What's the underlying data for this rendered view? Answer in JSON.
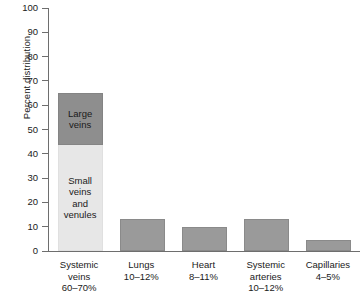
{
  "chart_data": {
    "type": "bar",
    "title": "",
    "xlabel": "",
    "ylabel": "Percent distribution",
    "ylim": [
      0,
      100
    ],
    "ytick_values": [
      0,
      10,
      20,
      30,
      40,
      50,
      60,
      70,
      80,
      90,
      100
    ],
    "ytick_labels": [
      "0",
      "10",
      "20",
      "30",
      "40",
      "50",
      "60",
      "70",
      "80",
      "90",
      "100"
    ],
    "grid": false,
    "legend": "none",
    "categories": [
      "Systemic veins\n60–70%",
      "Lungs\n10–12%",
      "Heart\n8–11%",
      "Systemic arteries\n10–12%",
      "Capillaries\n4–5%"
    ],
    "values": [
      65,
      13,
      10,
      13,
      4.5
    ],
    "bars": [
      {
        "category": "Systemic veins",
        "range_label": "60–70%",
        "total": 65,
        "stacked": true,
        "segments": [
          {
            "label": "Small\nveins\nand\nvenules",
            "value": 43.5,
            "from": 0,
            "to": 43.5,
            "color": "#e7e7e7"
          },
          {
            "label": "Large\nveins",
            "value": 21.5,
            "from": 43.5,
            "to": 65,
            "color": "#8e8e8e"
          }
        ]
      },
      {
        "category": "Lungs",
        "range_label": "10–12%",
        "total": 13,
        "stacked": false,
        "color": "#9a9a9a"
      },
      {
        "category": "Heart",
        "range_label": "8–11%",
        "total": 10,
        "stacked": false,
        "color": "#9a9a9a"
      },
      {
        "category": "Systemic arteries",
        "range_label": "10–12%",
        "total": 13,
        "stacked": false,
        "color": "#9a9a9a"
      },
      {
        "category": "Capillaries",
        "range_label": "4–5%",
        "total": 4.5,
        "stacked": false,
        "color": "#9a9a9a"
      }
    ],
    "x_tick_labels": [
      "Systemic\nveins\n60–70%",
      "Lungs\n10–12%",
      "Heart\n8–11%",
      "Systemic\narteries\n10–12%",
      "Capillaries\n4–5%"
    ],
    "colors": {
      "large_veins": "#8e8e8e",
      "small_veins_venules": "#e7e7e7",
      "other_bars": "#9a9a9a",
      "axis": "#6e6e6e",
      "text": "#1a1a1a",
      "background": "#ffffff"
    }
  }
}
